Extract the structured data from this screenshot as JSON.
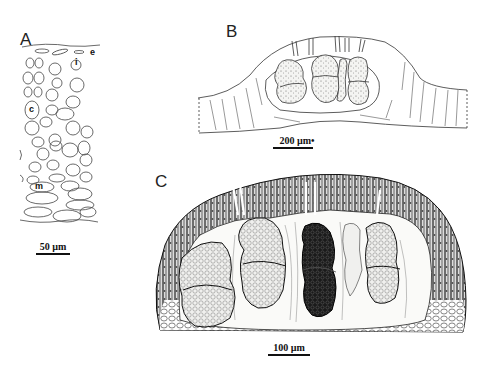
{
  "figure": {
    "panels": [
      {
        "id": "A",
        "label": "A",
        "scale_bar": "50 µm",
        "annotations": [
          "e",
          "i",
          "c",
          "m"
        ]
      },
      {
        "id": "B",
        "label": "B",
        "scale_bar": "200 µm",
        "scale_marker": "•"
      },
      {
        "id": "C",
        "label": "C",
        "scale_bar": "100 µm"
      }
    ]
  }
}
